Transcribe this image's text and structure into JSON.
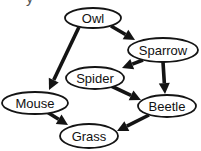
{
  "diagram": {
    "type": "directed-graph",
    "colors": {
      "background": "#ffffff",
      "stroke": "#141414",
      "node_fill": "#ffffff",
      "text": "#111111"
    },
    "partial_text_fragment": "y",
    "nodes": [
      {
        "id": "owl",
        "label": "Owl",
        "cx": 93,
        "cy": 18,
        "rx": 28,
        "ry": 10
      },
      {
        "id": "sparrow",
        "label": "Sparrow",
        "cx": 163,
        "cy": 50,
        "rx": 35,
        "ry": 12
      },
      {
        "id": "spider",
        "label": "Spider",
        "cx": 95,
        "cy": 78,
        "rx": 29,
        "ry": 11
      },
      {
        "id": "mouse",
        "label": "Mouse",
        "cx": 35,
        "cy": 103,
        "rx": 33,
        "ry": 11
      },
      {
        "id": "beetle",
        "label": "Beetle",
        "cx": 167,
        "cy": 106,
        "rx": 29,
        "ry": 11
      },
      {
        "id": "grass",
        "label": "Grass",
        "cx": 89,
        "cy": 136,
        "rx": 29,
        "ry": 12
      }
    ],
    "edges": [
      {
        "from": "owl",
        "to": "sparrow",
        "tail": [
          111,
          26
        ],
        "tip": [
          135,
          40
        ]
      },
      {
        "from": "owl",
        "to": "mouse",
        "tail": [
          79,
          27
        ],
        "tip": [
          49,
          90
        ]
      },
      {
        "from": "sparrow",
        "to": "spider",
        "tail": [
          143,
          60
        ],
        "tip": [
          122,
          68
        ]
      },
      {
        "from": "sparrow",
        "to": "beetle",
        "tail": [
          163,
          62
        ],
        "tip": [
          165,
          94
        ]
      },
      {
        "from": "spider",
        "to": "beetle",
        "tail": [
          109,
          85
        ],
        "tip": [
          141,
          100
        ]
      },
      {
        "from": "mouse",
        "to": "grass",
        "tail": [
          47,
          112
        ],
        "tip": [
          68,
          125
        ]
      },
      {
        "from": "beetle",
        "to": "grass",
        "tail": [
          149,
          115
        ],
        "tip": [
          117,
          131
        ]
      }
    ]
  }
}
